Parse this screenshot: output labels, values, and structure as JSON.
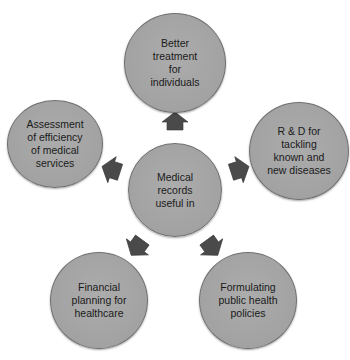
{
  "diagram": {
    "center": {
      "label": "Medical\nrecords\nuseful in"
    },
    "nodes": [
      {
        "position": "top",
        "label": "Better\ntreatment\nfor\nindividuals"
      },
      {
        "position": "right",
        "label": "R & D for\ntackling\nknown and\nnew diseases"
      },
      {
        "position": "bottom-right",
        "label": "Formulating\npublic health\npolicies"
      },
      {
        "position": "bottom-left",
        "label": "Financial\nplanning for\nhealthcare"
      },
      {
        "position": "left",
        "label": "Assessment\nof efficiency\nof medical\nservices"
      }
    ],
    "arrows": [
      {
        "direction": "up",
        "icon": "arrow-up-icon"
      },
      {
        "direction": "right",
        "icon": "arrow-right-icon"
      },
      {
        "direction": "down-right",
        "icon": "arrow-down-right-icon"
      },
      {
        "direction": "down-left",
        "icon": "arrow-down-left-icon"
      },
      {
        "direction": "left",
        "icon": "arrow-left-icon"
      }
    ],
    "colors": {
      "circle_fill": "#a6a6a6",
      "circle_border": "#6e6e6e",
      "arrow_fill": "#4a4a4a",
      "text": "#1a1a1a",
      "background": "#ffffff"
    }
  }
}
